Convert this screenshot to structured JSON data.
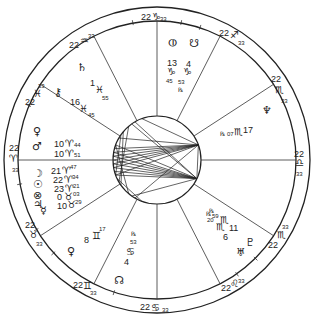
{
  "chart": {
    "type": "natal-wheel",
    "cusps": [
      {
        "house": 1,
        "label_deg": "22",
        "sign": "aries",
        "glyph": "♈",
        "label_min": "33"
      },
      {
        "house": 2,
        "label_deg": "22",
        "sign": "taurus",
        "glyph": "♉",
        "label_min": "33"
      },
      {
        "house": 3,
        "label_deg": "22",
        "sign": "gemini",
        "glyph": "♊",
        "label_min": "33"
      },
      {
        "house": 4,
        "label_deg": "22",
        "sign": "cancer",
        "glyph": "♋",
        "label_min": "33"
      },
      {
        "house": 5,
        "label_deg": "22",
        "sign": "leo",
        "glyph": "♌",
        "label_min": "33"
      },
      {
        "house": 6,
        "label_deg": "22",
        "sign": "scorpio",
        "glyph": "♏",
        "label_min": "33"
      },
      {
        "house": 7,
        "label_deg": "22",
        "sign": "libra",
        "glyph": "♎",
        "label_min": "33"
      },
      {
        "house": 8,
        "label_deg": "22",
        "sign": "scorpio",
        "glyph": "♏",
        "label_min": "33"
      },
      {
        "house": 9,
        "label_deg": "22",
        "sign": "sagittarius",
        "glyph": "♐",
        "label_min": "33"
      },
      {
        "house": 10,
        "label_deg": "22",
        "sign": "capricorn",
        "glyph": "♑",
        "label_min": "33"
      },
      {
        "house": 11,
        "label_deg": "22",
        "sign": "aquarius",
        "glyph": "♒",
        "label_min": "33"
      },
      {
        "house": 12,
        "label_deg": "22",
        "sign": "pisces",
        "glyph": "♓",
        "label_min": "33"
      }
    ],
    "planets": [
      {
        "name": "saturn",
        "glyph": "♄",
        "deg": "1",
        "sign_glyph": "♓",
        "min": "55",
        "retro": false
      },
      {
        "name": "chiron",
        "glyph": "⚷",
        "deg": "16",
        "sign_glyph": "♓",
        "min": "45",
        "retro": false
      },
      {
        "name": "venus",
        "glyph": "♀",
        "deg": "10",
        "sign_glyph": "♈",
        "min": "44",
        "retro": false
      },
      {
        "name": "mars",
        "glyph": "♂",
        "deg": "10",
        "sign_glyph": "♈",
        "min": "51",
        "retro": false
      },
      {
        "name": "moon",
        "glyph": "☽",
        "deg": "21",
        "sign_glyph": "♈",
        "min": "47",
        "retro": false
      },
      {
        "name": "sun",
        "glyph": "☉",
        "deg": "22",
        "sign_glyph": "♈",
        "min": "34",
        "retro": false
      },
      {
        "name": "part-of-fortune",
        "glyph": "⊗",
        "deg": "23",
        "sign_glyph": "♈",
        "min": "21",
        "retro": false
      },
      {
        "name": "jupiter",
        "glyph": "♃",
        "deg": "0",
        "sign_glyph": "♉",
        "min": "03",
        "retro": false
      },
      {
        "name": "mercury",
        "glyph": "☿",
        "deg": "10",
        "sign_glyph": "♉",
        "min": "29",
        "retro": false
      },
      {
        "name": "venus-2",
        "glyph": "♀",
        "deg": "8",
        "sign_glyph": "♊",
        "min": "17",
        "retro": false
      },
      {
        "name": "true-node",
        "glyph": "☊",
        "deg": "4",
        "sign_glyph": "♋",
        "min": "53",
        "retro": true
      },
      {
        "name": "pluto",
        "glyph": "♇",
        "deg": "20",
        "sign_glyph": "♏",
        "min": "59",
        "retro": true
      },
      {
        "name": "uranus",
        "glyph": "♅",
        "deg": "11",
        "sign_glyph": "♏",
        "min": "",
        "retro": false
      },
      {
        "name": "neptune-r",
        "glyph": "♏",
        "deg": "6",
        "sign_glyph": "♏",
        "min": "",
        "retro": true
      },
      {
        "name": "neptune",
        "glyph": "♆",
        "deg": "17",
        "sign_glyph": "♏",
        "min": "07",
        "retro": true
      },
      {
        "name": "lilith",
        "glyph": "⚸",
        "deg": "13",
        "sign_glyph": "♑",
        "min": "45",
        "retro": false
      },
      {
        "name": "south-node",
        "glyph": "☋",
        "deg": "4",
        "sign_glyph": "♑",
        "min": "53",
        "retro": true
      },
      {
        "name": "vertex",
        "glyph": "⦶",
        "deg": "",
        "sign_glyph": "",
        "min": "",
        "retro": false
      }
    ],
    "retro_glyph": "℞"
  }
}
